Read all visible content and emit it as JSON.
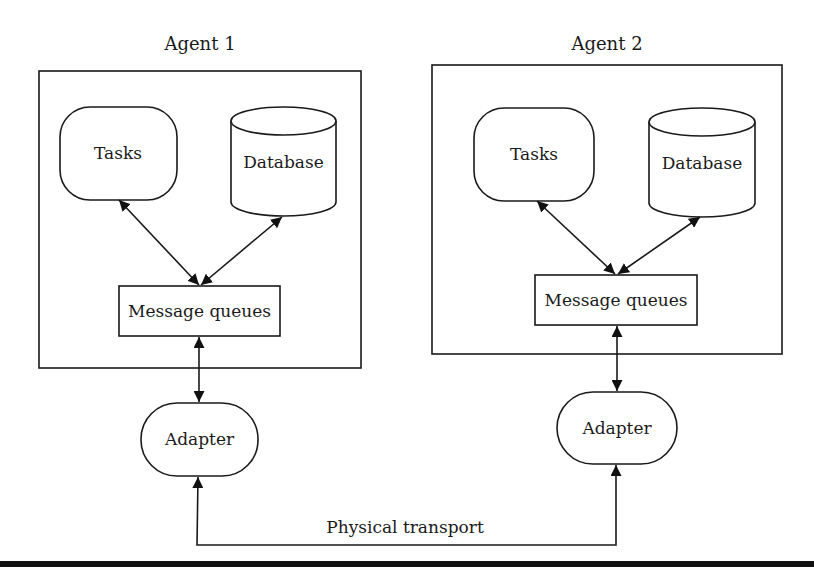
{
  "diagram": {
    "agents": [
      {
        "title": "Agent 1",
        "tasks_label": "Tasks",
        "database_label": "Database",
        "queues_label": "Message queues",
        "adapter_label": "Adapter"
      },
      {
        "title": "Agent 2",
        "tasks_label": "Tasks",
        "database_label": "Database",
        "queues_label": "Message queues",
        "adapter_label": "Adapter"
      }
    ],
    "transport_label": "Physical transport",
    "edges": [
      {
        "from": "Tasks",
        "to": "Message queues",
        "bidirectional": true
      },
      {
        "from": "Database",
        "to": "Message queues",
        "bidirectional": true
      },
      {
        "from": "Message queues",
        "to": "Adapter",
        "bidirectional": true
      },
      {
        "from": "Adapter (Agent 1)",
        "to": "Adapter (Agent 2)",
        "via": "Physical transport",
        "bidirectional": true
      }
    ],
    "colors": {
      "stroke": "#1a1a1a",
      "background": "#ffffff"
    }
  }
}
